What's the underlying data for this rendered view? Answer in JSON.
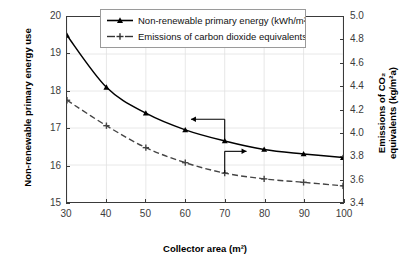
{
  "chart_data": {
    "type": "line",
    "title": "",
    "xlabel": "Collector area (m²)",
    "ylabel": "Non-renewable primary energy use",
    "y2label": "Emissions of CO₂ equivalents (kg/m²a)",
    "x": [
      30,
      40,
      50,
      60,
      70,
      80,
      90,
      100
    ],
    "xticks": [
      "30",
      "40",
      "50",
      "60",
      "70",
      "80",
      "90",
      "100"
    ],
    "xlim": [
      30,
      100
    ],
    "ylim": [
      15,
      20
    ],
    "yticks": [
      "15",
      "16",
      "17",
      "18",
      "19",
      "20"
    ],
    "y2lim": [
      3.4,
      5.0
    ],
    "y2ticks": [
      "3.4",
      "3.6",
      "3.8",
      "4.0",
      "4.2",
      "4.4",
      "4.6",
      "4.8",
      "5.0"
    ],
    "grid": true,
    "legend_position": "top-center",
    "series": [
      {
        "name": "Non-renewable primary energy (kWh/m²a)",
        "axis": "left",
        "style": "solid",
        "marker": "triangle",
        "color": "#000000",
        "values": [
          19.5,
          18.1,
          17.4,
          16.95,
          16.65,
          16.42,
          16.3,
          16.2
        ]
      },
      {
        "name": "Emissions of carbon dioxide equivalents",
        "axis": "right",
        "style": "dashed",
        "marker": "plus",
        "color": "#444444",
        "values": [
          4.28,
          4.06,
          3.87,
          3.74,
          3.65,
          3.6,
          3.57,
          3.54
        ]
      }
    ],
    "annotations": [
      {
        "name": "left-axis-arrow",
        "text": "",
        "direction": "left",
        "x": 70,
        "axis": "left"
      },
      {
        "name": "right-axis-arrow",
        "text": "",
        "direction": "right",
        "x": 70,
        "axis": "right"
      }
    ]
  },
  "axes": {
    "x_title": "Collector area (m²)",
    "y_left_title": "Non-renewable primary energy use",
    "y_right_title_line1": "Emissions of CO₂",
    "y_right_title_line2": "equivalents (kg/m²a)"
  },
  "legend": {
    "items": [
      {
        "label": "Non-renewable primary energy (kWh/m²a)",
        "style": "solid",
        "marker": "triangle"
      },
      {
        "label": "Emissions of carbon dioxide equivalents",
        "style": "dashed",
        "marker": "plus"
      },
      {
        "label": "(kg/m²a)",
        "style": "none",
        "marker": "none"
      }
    ]
  }
}
